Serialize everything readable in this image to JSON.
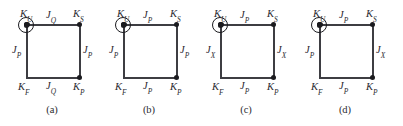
{
  "figure": {
    "type": "lattice-plaquette-diagram",
    "panel_count": 4,
    "node_color": "#1b1b1f",
    "edge_color": "#3d3d42",
    "background": "#ffffff"
  },
  "panels": [
    {
      "caption": "(a)",
      "nodes": {
        "upper_left": {
          "base": "K",
          "sub": "U"
        },
        "upper_right": {
          "base": "K",
          "sub": "S"
        },
        "lower_left": {
          "base": "K",
          "sub": "F",
          "circled": true
        },
        "lower_right": {
          "base": "K",
          "sub": "P"
        }
      },
      "edges": {
        "top": {
          "base": "J",
          "sub": "Q"
        },
        "right": {
          "base": "J",
          "sub": "P"
        },
        "bottom": {
          "base": "J",
          "sub": "Q"
        },
        "left": {
          "base": "J",
          "sub": "P"
        }
      }
    },
    {
      "caption": "(b)",
      "nodes": {
        "upper_left": {
          "base": "K",
          "sub": "U"
        },
        "upper_right": {
          "base": "K",
          "sub": "S"
        },
        "lower_left": {
          "base": "K",
          "sub": "F",
          "circled": true
        },
        "lower_right": {
          "base": "K",
          "sub": "P"
        }
      },
      "edges": {
        "top": {
          "base": "J",
          "sub": "P"
        },
        "right": {
          "base": "J",
          "sub": "P"
        },
        "bottom": {
          "base": "J",
          "sub": "P"
        },
        "left": {
          "base": "J",
          "sub": "P"
        }
      }
    },
    {
      "caption": "(c)",
      "nodes": {
        "upper_left": {
          "base": "K",
          "sub": "U"
        },
        "upper_right": {
          "base": "K",
          "sub": "S"
        },
        "lower_left": {
          "base": "K",
          "sub": "F",
          "circled": true
        },
        "lower_right": {
          "base": "K",
          "sub": "P"
        }
      },
      "edges": {
        "top": {
          "base": "J",
          "sub": "P"
        },
        "right": {
          "base": "J",
          "sub": "X"
        },
        "bottom": {
          "base": "J",
          "sub": "P"
        },
        "left": {
          "base": "J",
          "sub": "X"
        }
      }
    },
    {
      "caption": "(d)",
      "nodes": {
        "upper_left": {
          "base": "K",
          "sub": "U"
        },
        "upper_right": {
          "base": "K",
          "sub": "S"
        },
        "lower_left": {
          "base": "K",
          "sub": "F",
          "circled": true
        },
        "lower_right": {
          "base": "K",
          "sub": "P"
        }
      },
      "edges": {
        "top": {
          "base": "J",
          "sub": "P"
        },
        "right": {
          "base": "J",
          "sub": "X"
        },
        "bottom": {
          "base": "J",
          "sub": "P"
        },
        "left": {
          "base": "J",
          "sub": "P"
        }
      }
    }
  ]
}
